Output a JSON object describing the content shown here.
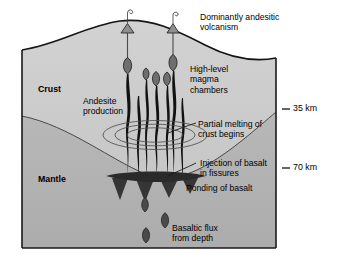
{
  "figure": {
    "type": "geological-cross-section",
    "title_visible": false,
    "colors": {
      "crust_fill": "#c9c9c9",
      "mantle_fill": "#b3b3b3",
      "magma_black": "#111111",
      "frame_stroke": "#1a1a1a",
      "background": "#ffffff",
      "text": "#000000"
    }
  },
  "layers": [
    {
      "id": "crust",
      "label": "Crust",
      "bold": true
    },
    {
      "id": "mantle",
      "label": "Mantle",
      "bold": true
    }
  ],
  "depth_scale": {
    "unit": "km",
    "ticks": [
      {
        "label": "35 km",
        "value": 35
      },
      {
        "label": "70 km",
        "value": 70
      }
    ]
  },
  "annotations": [
    {
      "id": "volcanism",
      "text": "Dominantly andesitic\nvolcanism"
    },
    {
      "id": "magma-chambers",
      "text": "High-level\nmagma\nchambers"
    },
    {
      "id": "andesite",
      "text": "Andesite\nproduction"
    },
    {
      "id": "partial-melting",
      "text": "Partial melting of\ncrust begins"
    },
    {
      "id": "injection",
      "text": "Injection of basalt\nin fissures"
    },
    {
      "id": "ponding",
      "text": "Ponding of basalt"
    },
    {
      "id": "basaltic-flux",
      "text": "Basaltic flux\nfrom depth"
    }
  ],
  "features": {
    "volcano_cones": 2,
    "magma_chamber_blobs": 5,
    "conduits": 7,
    "melt_rings": 3,
    "rising_blobs": 3
  }
}
